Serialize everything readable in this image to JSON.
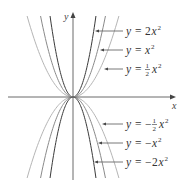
{
  "chart_data": {
    "type": "line",
    "title": "",
    "xlabel": "x",
    "ylabel": "y",
    "xlim": [
      -3.5,
      3.5
    ],
    "ylim": [
      -6.2,
      6.2
    ],
    "grid": false,
    "legend_position": "right (callout labels with arrows)",
    "series": [
      {
        "name": "y = 2x^2",
        "label_parts": {
          "lhs": "y",
          "eq": "=",
          "coef": "2",
          "neg": false,
          "frac": false
        },
        "a": 2,
        "color": "#3a3a3a",
        "label_y": 31,
        "arrow_tip_x": 95
      },
      {
        "name": "y = x^2",
        "label_parts": {
          "lhs": "y",
          "eq": "=",
          "coef": "",
          "neg": false,
          "frac": false
        },
        "a": 1,
        "color": "#8a8a8a",
        "label_y": 50,
        "arrow_tip_x": 100
      },
      {
        "name": "y = 1/2 x^2",
        "label_parts": {
          "lhs": "y",
          "eq": "=",
          "coef": "",
          "neg": false,
          "frac": true,
          "num": "1",
          "den": "2"
        },
        "a": 0.5,
        "color": "#b5b5b5",
        "label_y": 69,
        "arrow_tip_x": 104
      },
      {
        "name": "y = -1/2 x^2",
        "label_parts": {
          "lhs": "y",
          "eq": "=",
          "coef": "",
          "neg": true,
          "frac": true,
          "num": "1",
          "den": "2"
        },
        "a": -0.5,
        "color": "#b5b5b5",
        "label_y": 124,
        "arrow_tip_x": 102
      },
      {
        "name": "y = -x^2",
        "label_parts": {
          "lhs": "y",
          "eq": "=",
          "coef": "",
          "neg": true,
          "frac": false
        },
        "a": -1,
        "color": "#8a8a8a",
        "label_y": 143,
        "arrow_tip_x": 98
      },
      {
        "name": "y = -2x^2",
        "label_parts": {
          "lhs": "y",
          "eq": "=",
          "coef": "2",
          "neg": true,
          "frac": false
        },
        "a": -2,
        "color": "#3a3a3a",
        "label_y": 162,
        "arrow_tip_x": 94
      }
    ],
    "annotations": [
      "y = 2x²",
      "y = x²",
      "y = ½x²",
      "y = −½x²",
      "y = −x²",
      "y = −2x²"
    ]
  },
  "layout": {
    "origin": [
      73,
      97
    ],
    "px_per_unit": 13,
    "x_axis_left": 8,
    "x_axis_right": 176,
    "y_axis_top": 12,
    "y_axis_bottom": 180,
    "curve_y_extent": 81,
    "label_x": 126
  },
  "axes": {
    "x_label": "x",
    "y_label": "y"
  }
}
